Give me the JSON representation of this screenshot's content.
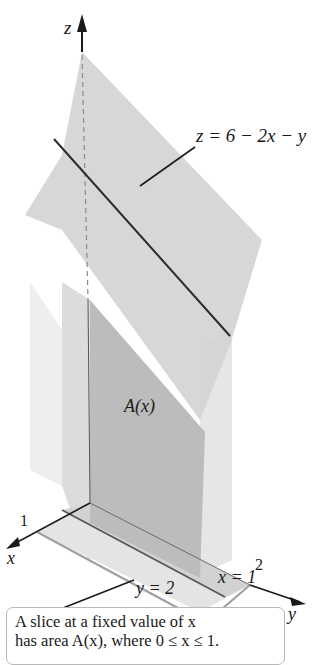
{
  "figure": {
    "axes": {
      "z_label": "z",
      "x_label": "x",
      "y_label": "y",
      "x_tick": "1",
      "y_tick": "2"
    },
    "plane_label": "z = 6 − 2x − y",
    "slice_label": "A(x)",
    "boundary_labels": {
      "y_eq": "y = 2",
      "x_eq": "x = 1"
    },
    "caption": {
      "line1": "A slice at a fixed value of x",
      "line2": "has area A(x), where 0 ≤ x ≤ 1."
    },
    "colors": {
      "plane_fill": "#d6d6d6",
      "slice_fill": "#bdbdbd",
      "solid_light": "#ececec",
      "edge_dark": "#2b2b2b",
      "edge_gray": "#9a9a9a"
    }
  }
}
